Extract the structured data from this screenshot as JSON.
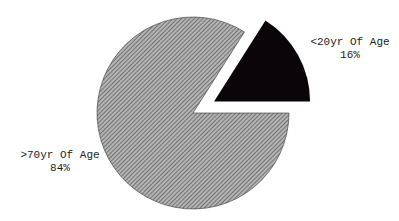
{
  "chart_data": {
    "type": "pie",
    "title": "",
    "exploded": true,
    "slices": [
      {
        "label": ">70yr Of Age",
        "value": 84,
        "display": "84%",
        "fill": "hatched-gray",
        "color": "#8a8a8a"
      },
      {
        "label": "<20yr Of Age",
        "value": 16,
        "display": "16%",
        "fill": "solid-black",
        "color": "#0a0508",
        "exploded": true
      }
    ]
  },
  "labels": {
    "young": {
      "name": "<20yr Of Age",
      "pct": "16%"
    },
    "old": {
      "name": ">70yr Of Age",
      "pct": "84%"
    }
  }
}
